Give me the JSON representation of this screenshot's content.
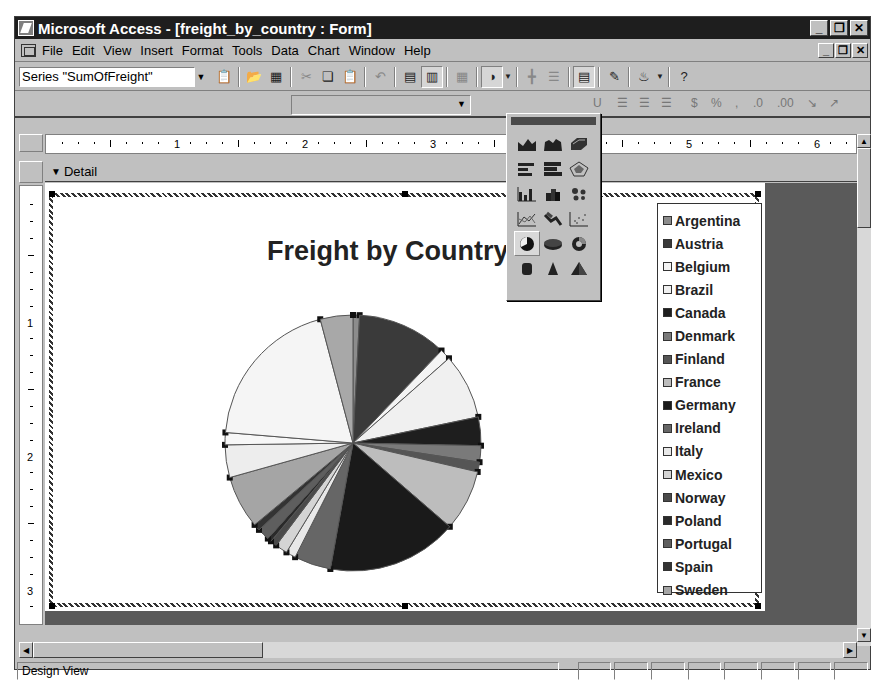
{
  "window": {
    "title": "Microsoft Access - [freight_by_country : Form]",
    "caption_buttons": [
      "minimize",
      "restore",
      "close"
    ]
  },
  "menu": {
    "items": [
      {
        "label": "File",
        "accel": "F"
      },
      {
        "label": "Edit",
        "accel": "E"
      },
      {
        "label": "View",
        "accel": "V"
      },
      {
        "label": "Insert",
        "accel": "I"
      },
      {
        "label": "Format",
        "accel": "o"
      },
      {
        "label": "Tools",
        "accel": "T"
      },
      {
        "label": "Data",
        "accel": "D"
      },
      {
        "label": "Chart",
        "accel": "C"
      },
      {
        "label": "Window",
        "accel": "W"
      },
      {
        "label": "Help",
        "accel": "H"
      }
    ]
  },
  "toolbar": {
    "series_combo_value": "Series \"SumOfFreight\"",
    "buttons": [
      "format-selected-object",
      "import-file",
      "view-datasheet",
      "cut",
      "copy",
      "paste",
      "undo",
      "by-row",
      "by-column",
      "data-table",
      "chart-type",
      "category-axis-gridlines",
      "value-axis-gridlines",
      "legend",
      "drawing",
      "fill-color",
      "help"
    ]
  },
  "chart_type_palette": {
    "selected": "pie-chart",
    "items": [
      "area-chart",
      "3d-area-chart",
      "3d-surface-chart",
      "bar-chart",
      "3d-bar-chart",
      "radar-chart",
      "column-chart",
      "3d-column-chart",
      "bubble-chart",
      "line-chart",
      "3d-line-chart",
      "xy-scatter-chart",
      "pie-chart",
      "3d-pie-chart",
      "doughnut-chart",
      "cylinder-chart",
      "cone-chart",
      "pyramid-chart"
    ]
  },
  "ruler": {
    "horizontal_labels": [
      "1",
      "2",
      "3",
      "4",
      "5",
      "6"
    ],
    "vertical_labels": [
      "1",
      "2",
      "3"
    ]
  },
  "section": {
    "label": "Detail"
  },
  "status": {
    "text": "Design View"
  },
  "chart_data": {
    "type": "pie",
    "title": "Freight by Country",
    "legend_position": "right",
    "categories": [
      "Argentina",
      "Austria",
      "Belgium",
      "Brazil",
      "Canada",
      "Denmark",
      "Finland",
      "France",
      "Germany",
      "Ireland",
      "Italy",
      "Mexico",
      "Norway",
      "Poland",
      "Portugal",
      "Spain",
      "Sweden"
    ],
    "values": [
      0.8,
      11.0,
      1.3,
      8.0,
      3.5,
      2.0,
      1.2,
      7.5,
      16.0,
      4.5,
      1.2,
      1.5,
      0.8,
      0.5,
      1.5,
      0.8,
      6.5
    ],
    "colors": [
      "#8c8c8c",
      "#3a3a3a",
      "#f4f4f4",
      "#f0f0f0",
      "#1e1e1e",
      "#7a7a7a",
      "#555555",
      "#bdbdbd",
      "#1a1a1a",
      "#666666",
      "#e8e8e8",
      "#d4d4d4",
      "#4a4a4a",
      "#2a2a2a",
      "#5e5e5e",
      "#333333",
      "#a5a5a5"
    ],
    "pie_order_note": "slices clockwise from 12 o'clock; remaining large light slices include USA/UK/Venezuela-like areas not in visible legend",
    "extra_slices": [
      {
        "label": "",
        "value": 4.0,
        "color": "#ededed"
      },
      {
        "label": "",
        "value": 1.5,
        "color": "#f7f7f7"
      },
      {
        "label": "",
        "value": 19.0,
        "color": "#f5f5f5"
      },
      {
        "label": "",
        "value": 4.0,
        "color": "#a8a8a8"
      }
    ]
  }
}
